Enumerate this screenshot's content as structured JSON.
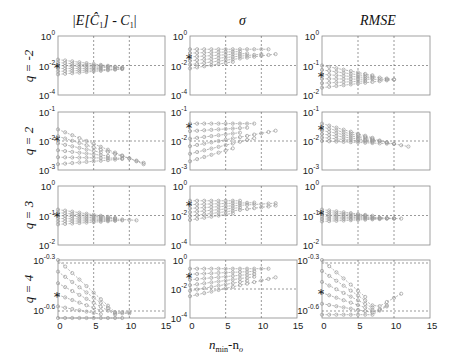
{
  "chart_data": {
    "type": "line",
    "layout": "grid 4 rows x 3 columns, log-scale y axes, shared x axis 0-15",
    "column_titles": [
      "|E[Ĉ1] - C1|",
      "σ",
      "RMSE"
    ],
    "row_labels": [
      "q = -2",
      "q = 2",
      "q = 3",
      "q = 4"
    ],
    "xlabel": "n_min-n_o",
    "x_ticks": [
      0,
      5,
      10,
      15
    ],
    "xlim": [
      0,
      15
    ],
    "grid": "dashed at x=5,10 and one y decade",
    "marker_note": "star (*) at x=0 marks reference value; gray circle-marker dashed curves are multiple series",
    "panels": [
      {
        "row": 0,
        "col": 0,
        "ylim_exp": [
          -4,
          0
        ],
        "y_tick_labels": [
          "10^0",
          "10^-2",
          "10^-4"
        ],
        "series_y_exp_range": [
          -2.6,
          -1.6
        ],
        "star_y_exp": -2.1
      },
      {
        "row": 0,
        "col": 1,
        "ylim_exp": [
          -4,
          0
        ],
        "y_tick_labels": [
          "10^0",
          "10^-2",
          "10^-4"
        ],
        "series_y_exp_range": [
          -2.2,
          -0.9
        ],
        "star_y_exp": -1.5
      },
      {
        "row": 0,
        "col": 2,
        "ylim_exp": [
          -2,
          0
        ],
        "y_tick_labels": [
          "10^0",
          "10^-1",
          "10^-2"
        ],
        "series_y_exp_range": [
          -1.75,
          -1.0
        ],
        "star_y_exp": -1.35
      },
      {
        "row": 1,
        "col": 0,
        "ylim_exp": [
          -3,
          -1
        ],
        "y_tick_labels": [
          "10^-1",
          "10^-2",
          "10^-3"
        ],
        "series_y_exp_range": [
          -2.8,
          -1.6
        ],
        "star_y_exp": -1.95
      },
      {
        "row": 1,
        "col": 1,
        "ylim_exp": [
          -3,
          -1
        ],
        "y_tick_labels": [
          "10^-1",
          "10^-2",
          "10^-3"
        ],
        "series_y_exp_range": [
          -2.7,
          -1.4
        ],
        "star_y_exp": -1.5
      },
      {
        "row": 1,
        "col": 2,
        "ylim_exp": [
          -3,
          -1
        ],
        "y_tick_labels": [
          "10^-1",
          "10^-2",
          "10^-3"
        ],
        "series_y_exp_range": [
          -2.0,
          -1.4
        ],
        "star_y_exp": -1.6
      },
      {
        "row": 2,
        "col": 0,
        "ylim_exp": [
          -2,
          0
        ],
        "y_tick_labels": [
          "10^0",
          "10^-1",
          "10^-2"
        ],
        "series_y_exp_range": [
          -1.3,
          -0.8
        ],
        "star_y_exp": -1.0
      },
      {
        "row": 2,
        "col": 1,
        "ylim_exp": [
          -4,
          0
        ],
        "y_tick_labels": [
          "10^0",
          "10^-2",
          "10^-4"
        ],
        "series_y_exp_range": [
          -2.3,
          -1.0
        ],
        "star_y_exp": -1.3
      },
      {
        "row": 2,
        "col": 2,
        "ylim_exp": [
          -2,
          0
        ],
        "y_tick_labels": [
          "10^0",
          "10^-1",
          "10^-2"
        ],
        "series_y_exp_range": [
          -1.2,
          -0.8
        ],
        "star_y_exp": -0.95
      },
      {
        "row": 3,
        "col": 0,
        "ylim_exp": [
          -0.65,
          -0.3
        ],
        "y_tick_labels": [
          "10^-0.3",
          "10^-0.6"
        ],
        "series_y_exp_range": [
          -0.65,
          -0.3
        ],
        "star_y_exp": -0.52
      },
      {
        "row": 3,
        "col": 1,
        "ylim_exp": [
          -4,
          0
        ],
        "y_tick_labels": [
          "10^0",
          "10^-2",
          "10^-4"
        ],
        "series_y_exp_range": [
          -2.5,
          -0.6
        ],
        "star_y_exp": -1.2
      },
      {
        "row": 3,
        "col": 2,
        "ylim_exp": [
          -0.65,
          -0.3
        ],
        "y_tick_labels": [
          "10^-0.3",
          "10^-0.6"
        ],
        "series_y_exp_range": [
          -0.63,
          -0.3
        ],
        "star_y_exp": -0.5
      }
    ]
  },
  "labels": {
    "col_title_1": "|E[Ĉ",
    "col_title_1b": "] - C",
    "col_title_1c": "|",
    "col_title_2": "σ",
    "col_title_3": "RMSE",
    "row_1": "q = -2",
    "row_2": "q = 2",
    "row_3": "q = 3",
    "row_4": "q = 4",
    "xlabel_n": "n",
    "xlabel_sub": "min",
    "xlabel_rest": "-n",
    "xlabel_sub2": "o",
    "x0": "0",
    "x5": "5",
    "x10": "10",
    "x15": "15",
    "ten": "10",
    "e0": "0",
    "em1": "-1",
    "em2": "-2",
    "em3": "-3",
    "em4": "-4",
    "em03": "-0.3",
    "em06": "-0.6",
    "sub1": "1",
    "star": "*"
  },
  "colors": {
    "axis": "#8a8a8a",
    "grid": "#555555",
    "series": "#9a9a9a",
    "star": "#222222"
  }
}
